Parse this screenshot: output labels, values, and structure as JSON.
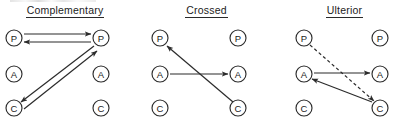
{
  "figure": {
    "background_color": "#ffffff",
    "ink_color": "#2b2b2b",
    "width": 407,
    "height": 122
  },
  "panels": [
    {
      "id": "complementary",
      "title": "Complementary",
      "title_underlined": true,
      "nodes": [
        {
          "id": "p_left",
          "label": "P",
          "cx": 14,
          "cy": 38,
          "r": 8
        },
        {
          "id": "a_left",
          "label": "A",
          "cx": 14,
          "cy": 74,
          "r": 8
        },
        {
          "id": "c_left",
          "label": "C",
          "cx": 14,
          "cy": 108,
          "r": 8
        },
        {
          "id": "p_right",
          "label": "P",
          "cx": 101,
          "cy": 38,
          "r": 8
        },
        {
          "id": "a_right",
          "label": "A",
          "cx": 101,
          "cy": 74,
          "r": 8
        },
        {
          "id": "c_right",
          "label": "C",
          "cx": 101,
          "cy": 108,
          "r": 8
        }
      ],
      "edges": [
        {
          "id": "e1",
          "from": "p_left",
          "to": "p_right",
          "style": "solid",
          "arrow": "end",
          "x1": 24,
          "y1": 34,
          "x2": 91,
          "y2": 34
        },
        {
          "id": "e2",
          "from": "p_right",
          "to": "p_left",
          "style": "solid",
          "arrow": "end",
          "x1": 91,
          "y1": 42,
          "x2": 24,
          "y2": 42
        },
        {
          "id": "e3",
          "from": "p_right",
          "to": "c_left",
          "style": "solid",
          "arrow": "end",
          "x1": 94,
          "y1": 46,
          "x2": 21,
          "y2": 102
        },
        {
          "id": "e4",
          "from": "c_left",
          "to": "p_right",
          "style": "solid",
          "arrow": "end",
          "x1": 24,
          "y1": 109,
          "x2": 97,
          "y2": 51
        }
      ]
    },
    {
      "id": "crossed",
      "title": "Crossed",
      "title_underlined": true,
      "nodes": [
        {
          "id": "p_left",
          "label": "P",
          "cx": 17,
          "cy": 38,
          "r": 8
        },
        {
          "id": "a_left",
          "label": "A",
          "cx": 17,
          "cy": 74,
          "r": 8
        },
        {
          "id": "c_left",
          "label": "C",
          "cx": 17,
          "cy": 108,
          "r": 8
        },
        {
          "id": "p_right",
          "label": "P",
          "cx": 95,
          "cy": 38,
          "r": 8
        },
        {
          "id": "a_right",
          "label": "A",
          "cx": 95,
          "cy": 74,
          "r": 8
        },
        {
          "id": "c_right",
          "label": "C",
          "cx": 95,
          "cy": 108,
          "r": 8
        }
      ],
      "edges": [
        {
          "id": "e1",
          "from": "a_left",
          "to": "a_right",
          "style": "solid",
          "arrow": "end",
          "x1": 27,
          "y1": 74,
          "x2": 85,
          "y2": 74
        },
        {
          "id": "e2",
          "from": "c_right",
          "to": "p_left",
          "style": "solid",
          "arrow": "end",
          "x1": 90,
          "y1": 102,
          "x2": 24,
          "y2": 46
        }
      ]
    },
    {
      "id": "ulterior",
      "title": "Ulterior",
      "title_underlined": true,
      "nodes": [
        {
          "id": "p_left",
          "label": "P",
          "cx": 22,
          "cy": 38,
          "r": 8
        },
        {
          "id": "a_left",
          "label": "A",
          "cx": 22,
          "cy": 74,
          "r": 8
        },
        {
          "id": "c_left",
          "label": "C",
          "cx": 22,
          "cy": 108,
          "r": 8
        },
        {
          "id": "p_right",
          "label": "P",
          "cx": 98,
          "cy": 38,
          "r": 8
        },
        {
          "id": "a_right",
          "label": "A",
          "cx": 98,
          "cy": 74,
          "r": 8
        },
        {
          "id": "c_right",
          "label": "C",
          "cx": 98,
          "cy": 108,
          "r": 8
        }
      ],
      "edges": [
        {
          "id": "e1",
          "from": "a_left",
          "to": "a_right",
          "style": "solid",
          "arrow": "end",
          "x1": 32,
          "y1": 73,
          "x2": 88,
          "y2": 73
        },
        {
          "id": "e2",
          "from": "p_left",
          "to": "c_right",
          "style": "dashed",
          "arrow": "end",
          "x1": 28,
          "y1": 45,
          "x2": 92,
          "y2": 101
        },
        {
          "id": "e3",
          "from": "c_right",
          "to": "a_left",
          "style": "solid",
          "arrow": "end",
          "x1": 90,
          "y1": 102,
          "x2": 30,
          "y2": 79
        }
      ]
    }
  ],
  "legend": {
    "node_meanings": [
      {
        "symbol": "P",
        "name": "Parent ego state"
      },
      {
        "symbol": "A",
        "name": "Adult ego state"
      },
      {
        "symbol": "C",
        "name": "Child ego state"
      }
    ]
  }
}
